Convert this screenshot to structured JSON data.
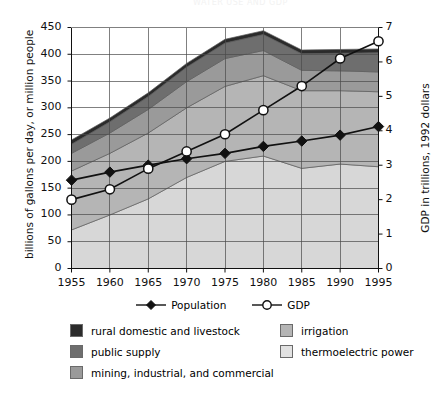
{
  "page": {
    "cut_header_text": "WATER USE AND GDP"
  },
  "chart_data": {
    "type": "area",
    "title": "",
    "subtitle": "",
    "xlabel": "",
    "ylabel": "billions of gallons per day, or million people",
    "y2label": "GDP in trillions, 1992 dollars",
    "grid": true,
    "legend_position": "bottom",
    "x": [
      1955,
      1960,
      1965,
      1970,
      1975,
      1980,
      1985,
      1990,
      1995
    ],
    "categories": [
      "1955",
      "1960",
      "1965",
      "1970",
      "1975",
      "1980",
      "1985",
      "1990",
      "1995"
    ],
    "ylim": [
      0,
      450
    ],
    "yticks": [
      0,
      50,
      100,
      150,
      200,
      250,
      300,
      350,
      400,
      450
    ],
    "y2lim": [
      0,
      7
    ],
    "y2ticks": [
      0,
      1,
      2,
      3,
      4,
      5,
      6,
      7
    ],
    "xlim": [
      1955,
      1995
    ],
    "xticks": [
      1955,
      1960,
      1965,
      1970,
      1975,
      1980,
      1985,
      1990,
      1995
    ],
    "stacked": true,
    "stack_order_bottom_to_top": [
      "thermoelectric power",
      "irrigation",
      "mining, industrial, and commercial",
      "public supply",
      "rural domestic and livestock"
    ],
    "series": [
      {
        "name": "thermoelectric power",
        "axis": "left",
        "color": "#d7d7d7",
        "values": [
          72,
          100,
          130,
          170,
          200,
          210,
          187,
          195,
          190
        ]
      },
      {
        "name": "irrigation",
        "axis": "left",
        "color": "#b5b5b5",
        "values": [
          110,
          115,
          123,
          130,
          140,
          150,
          145,
          137,
          140
        ]
      },
      {
        "name": "mining, industrial, and commercial",
        "axis": "left",
        "color": "#9a9a9a",
        "values": [
          33,
          38,
          44,
          49,
          52,
          47,
          38,
          37,
          37
        ]
      },
      {
        "name": "public supply",
        "axis": "left",
        "color": "#6e6e6e",
        "values": [
          17,
          21,
          24,
          27,
          29,
          30,
          31,
          33,
          36
        ]
      },
      {
        "name": "rural domestic and livestock",
        "axis": "left",
        "color": "#2b2b2b",
        "values": [
          8,
          7,
          7,
          7,
          7,
          7,
          7,
          7,
          7
        ]
      }
    ],
    "total_water_use": [
      240,
      281,
      328,
      383,
      428,
      444,
      408,
      409,
      410
    ],
    "lines": [
      {
        "name": "Population",
        "axis": "left",
        "marker": "filled-diamond",
        "color": "#111111",
        "values": [
          165,
          180,
          193,
          205,
          215,
          228,
          238,
          249,
          265
        ]
      },
      {
        "name": "GDP",
        "axis": "right",
        "marker": "open-circle",
        "color": "#111111",
        "values": [
          2.0,
          2.3,
          2.9,
          3.4,
          3.9,
          4.6,
          5.3,
          6.1,
          6.6
        ]
      }
    ]
  },
  "axes": {
    "left_title": "billions of gallons per day, or million people",
    "right_title": "GDP in trillions, 1992 dollars",
    "left_ticks": [
      "450",
      "400",
      "350",
      "300",
      "250",
      "200",
      "150",
      "100",
      "50",
      "0"
    ],
    "right_ticks": [
      "7",
      "6",
      "5",
      "4",
      "3",
      "2",
      "1",
      "0"
    ],
    "x_ticks": [
      "1955",
      "1960",
      "1965",
      "1970",
      "1975",
      "1980",
      "1985",
      "1990",
      "1995"
    ]
  },
  "legend": {
    "lines": [
      {
        "label": "Population",
        "marker": "filled-diamond"
      },
      {
        "label": "GDP",
        "marker": "open-circle"
      }
    ],
    "areas_left": [
      {
        "label": "rural domestic and livestock",
        "color": "#2b2b2b"
      },
      {
        "label": "public supply",
        "color": "#6e6e6e"
      },
      {
        "label": "mining, industrial, and commercial",
        "color": "#9a9a9a"
      }
    ],
    "areas_right": [
      {
        "label": "irrigation",
        "color": "#b5b5b5"
      },
      {
        "label": "thermoelectric power",
        "color": "#e2e2e2"
      }
    ]
  }
}
